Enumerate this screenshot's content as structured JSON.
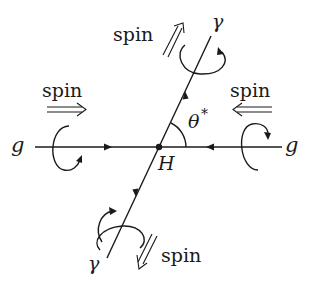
{
  "diagram": {
    "title": "",
    "type": "Higgs production and decay spin diagram",
    "vertex": {
      "label": "H",
      "x": 159,
      "y": 147
    },
    "angle": {
      "label": "θ",
      "superscript": "*"
    },
    "particles": [
      {
        "id": "gluon-left",
        "label": "g",
        "spin_label": "spin",
        "spin_direction": "right"
      },
      {
        "id": "gluon-right",
        "label": "g",
        "spin_label": "spin",
        "spin_direction": "left"
      },
      {
        "id": "photon-top",
        "label": "γ",
        "spin_label": "spin",
        "spin_direction": "up-right"
      },
      {
        "id": "photon-bottom",
        "label": "γ",
        "spin_label": "spin",
        "spin_direction": "down-left"
      }
    ],
    "colors": {
      "ink": "#1a1a1a",
      "background": "#ffffff"
    }
  }
}
